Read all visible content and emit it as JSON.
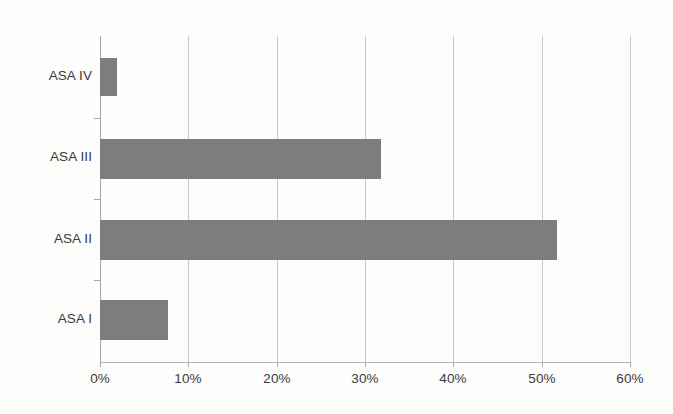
{
  "chart_data": {
    "type": "bar",
    "orientation": "horizontal",
    "title": "",
    "subtitle": "",
    "xlabel": "",
    "ylabel": "",
    "categories": [
      "ASA I",
      "ASA II",
      "ASA III",
      "ASA IV"
    ],
    "values": [
      7.7,
      51.7,
      31.8,
      1.9
    ],
    "value_labels": [
      "7.7%",
      "51.7%",
      "31.8%",
      "1.9%"
    ],
    "series": [
      {
        "name": "ASA classification distribution",
        "values": [
          7.7,
          51.7,
          31.8,
          1.9
        ]
      }
    ],
    "xlim": [
      0,
      60
    ],
    "xticks": [
      0,
      10,
      20,
      30,
      40,
      50,
      60
    ],
    "xtick_labels": [
      "0%",
      "10%",
      "20%",
      "30%",
      "40%",
      "50%",
      "60%"
    ],
    "grid": true,
    "grid_axis": "x",
    "legend": false,
    "legend_position": "none",
    "annotations": []
  },
  "style": {
    "bar_color": "#7d7d7d",
    "gridline_color": "#c9c9c7",
    "axis_color": "#a8a8a6",
    "background_color": "#fdfdfc",
    "text_color": "#3a3a38"
  },
  "geometry": {
    "plot_left": 100,
    "plot_top": 36,
    "plot_width": 530,
    "plot_height": 326,
    "px_per_percent": 8.833,
    "bars": [
      {
        "category": "ASA IV",
        "top": 58,
        "height": 38,
        "value": 1.9
      },
      {
        "category": "ASA III",
        "top": 139,
        "height": 40,
        "value": 31.8
      },
      {
        "category": "ASA II",
        "top": 220,
        "height": 40,
        "value": 51.7
      },
      {
        "category": "ASA I",
        "top": 300,
        "height": 40,
        "value": 7.7
      }
    ],
    "category_label_centers": [
      77,
      158,
      240,
      320
    ],
    "ytick_positions": [
      118,
      199,
      280
    ]
  }
}
